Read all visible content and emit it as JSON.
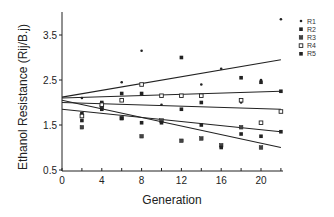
{
  "chart_data": {
    "type": "scatter",
    "title": "",
    "xlabel": "Generation",
    "ylabel": "Ethanol Resistance (Rij/B.j)",
    "xlim": [
      0,
      22
    ],
    "ylim": [
      0.5,
      4.0
    ],
    "xticks": [
      0,
      4,
      8,
      12,
      16,
      20
    ],
    "yticks": [
      0.5,
      1.5,
      2.5,
      3.5
    ],
    "grid": false,
    "legend_position": "upper right, outside plot",
    "series": [
      {
        "name": "R1",
        "marker": "small-dot",
        "points": [
          [
            2,
            2.1
          ],
          [
            6,
            2.45
          ],
          [
            8,
            3.15
          ],
          [
            10,
            1.95
          ],
          [
            14,
            2.4
          ],
          [
            16,
            2.75
          ],
          [
            18,
            2.0
          ],
          [
            20,
            2.5
          ],
          [
            22,
            3.85
          ]
        ]
      },
      {
        "name": "R2",
        "marker": "filled-square",
        "points": [
          [
            2,
            1.75
          ],
          [
            4,
            2.0
          ],
          [
            6,
            2.2
          ],
          [
            8,
            2.2
          ],
          [
            12,
            3.0
          ],
          [
            14,
            2.0
          ],
          [
            18,
            2.55
          ],
          [
            20,
            2.45
          ],
          [
            22,
            2.25
          ]
        ]
      },
      {
        "name": "R3",
        "marker": "x-square",
        "points": [
          [
            2,
            1.45
          ],
          [
            4,
            1.9
          ],
          [
            6,
            1.65
          ],
          [
            8,
            1.25
          ],
          [
            10,
            1.6
          ],
          [
            12,
            1.15
          ],
          [
            14,
            1.2
          ],
          [
            16,
            1.05
          ],
          [
            18,
            1.45
          ],
          [
            20,
            1.0
          ]
        ]
      },
      {
        "name": "R4",
        "marker": "open-square",
        "points": [
          [
            2,
            1.7
          ],
          [
            4,
            1.95
          ],
          [
            6,
            2.05
          ],
          [
            8,
            2.4
          ],
          [
            10,
            2.15
          ],
          [
            12,
            2.15
          ],
          [
            14,
            2.15
          ],
          [
            18,
            2.05
          ],
          [
            20,
            1.55
          ],
          [
            22,
            1.8
          ]
        ]
      },
      {
        "name": "R5",
        "marker": "filled-square",
        "points": [
          [
            2,
            1.6
          ],
          [
            4,
            1.85
          ],
          [
            6,
            1.65
          ],
          [
            8,
            1.55
          ],
          [
            10,
            1.55
          ],
          [
            12,
            1.85
          ],
          [
            14,
            1.5
          ],
          [
            16,
            1.0
          ],
          [
            18,
            1.3
          ],
          [
            20,
            1.25
          ],
          [
            22,
            1.35
          ]
        ]
      }
    ],
    "regression_lines": [
      {
        "name": "fit-1",
        "from": [
          0,
          2.12
        ],
        "to": [
          22,
          2.95
        ]
      },
      {
        "name": "fit-2",
        "from": [
          0,
          2.1
        ],
        "to": [
          22,
          2.25
        ]
      },
      {
        "name": "fit-3",
        "from": [
          0,
          2.0
        ],
        "to": [
          22,
          1.85
        ]
      },
      {
        "name": "fit-4",
        "from": [
          0,
          1.85
        ],
        "to": [
          22,
          1.35
        ]
      },
      {
        "name": "fit-5",
        "from": [
          0,
          2.05
        ],
        "to": [
          22,
          1.0
        ]
      }
    ]
  },
  "axes": {
    "x_title": "Generation",
    "y_title": "Ethanol Resistance (Rij/B.j)",
    "x_tick_labels": [
      "0",
      "4",
      "8",
      "12",
      "16",
      "20"
    ],
    "y_tick_labels": [
      "0.5",
      "1.5",
      "2.5",
      "3.5"
    ]
  },
  "legend": {
    "items": [
      {
        "label": "R1",
        "marker": "small-dot"
      },
      {
        "label": "R2",
        "marker": "filled-square"
      },
      {
        "label": "R3",
        "marker": "x-square"
      },
      {
        "label": "R4",
        "marker": "open-square"
      },
      {
        "label": "R5",
        "marker": "filled-square"
      }
    ]
  },
  "colors": {
    "ink": "#222222",
    "background": "#ffffff"
  }
}
